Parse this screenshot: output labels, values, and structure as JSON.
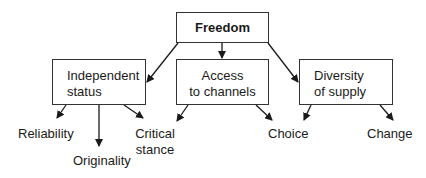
{
  "diagram": {
    "root": {
      "label": "Freedom"
    },
    "categories": [
      {
        "id": "independent",
        "line1": "Independent",
        "line2": "status"
      },
      {
        "id": "access",
        "line1": "Access",
        "line2": "to channels"
      },
      {
        "id": "diversity",
        "line1": "Diversity",
        "line2": "of supply"
      }
    ],
    "leaves": [
      {
        "id": "reliability",
        "line1": "Reliability",
        "parents": [
          "independent"
        ]
      },
      {
        "id": "originality",
        "line1": "Originality",
        "parents": [
          "independent"
        ]
      },
      {
        "id": "critical",
        "line1": "Critical",
        "line2": "stance",
        "parents": [
          "independent",
          "access"
        ]
      },
      {
        "id": "choice",
        "line1": "Choice",
        "parents": [
          "access",
          "diversity"
        ]
      },
      {
        "id": "change",
        "line1": "Change",
        "parents": [
          "diversity"
        ]
      }
    ],
    "colors": {
      "stroke": "#1a1a1a",
      "text": "#1a1a1a",
      "background": "#ffffff"
    }
  }
}
